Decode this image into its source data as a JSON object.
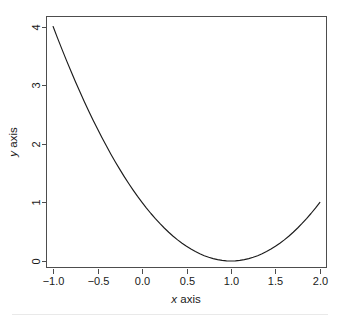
{
  "figure": {
    "background_color": "#ffffff",
    "ink_color": "#1c1c1c",
    "axis_color": "#4d4d4d",
    "xlabel_var": "x",
    "xlabel_rest": " axis",
    "ylabel_var": "y",
    "ylabel_rest": " axis"
  },
  "chart_data": {
    "type": "line",
    "title": "",
    "subtitle": "",
    "xlabel": "x axis",
    "ylabel": "y axis",
    "grid": false,
    "legend": false,
    "legend_position": "none",
    "xlim": [
      -1.08,
      2.08
    ],
    "ylim": [
      -0.12,
      4.18
    ],
    "xticks": [
      -1.0,
      -0.5,
      0.0,
      0.5,
      1.0,
      1.5,
      2.0
    ],
    "xticklabels": [
      "-1.0",
      "-0.5",
      "0.0",
      "0.5",
      "1.0",
      "1.5",
      "2.0"
    ],
    "yticks": [
      0,
      1,
      2,
      3,
      4
    ],
    "yticklabels": [
      "0",
      "1",
      "2",
      "3",
      "4"
    ],
    "ytick_label_rotation": -90,
    "function": "y = (x - 1)^2",
    "series": [
      {
        "name": "y = (x - 1)^2",
        "color": "#1c1c1c",
        "x": [
          -1.0,
          -0.95,
          -0.9,
          -0.85,
          -0.8,
          -0.75,
          -0.7,
          -0.65,
          -0.6,
          -0.55,
          -0.5,
          -0.45,
          -0.4,
          -0.35,
          -0.3,
          -0.25,
          -0.2,
          -0.15,
          -0.1,
          -0.05,
          0.0,
          0.05,
          0.1,
          0.15,
          0.2,
          0.25,
          0.3,
          0.35,
          0.4,
          0.45,
          0.5,
          0.55,
          0.6,
          0.65,
          0.7,
          0.75,
          0.8,
          0.85,
          0.9,
          0.95,
          1.0,
          1.05,
          1.1,
          1.15,
          1.2,
          1.25,
          1.3,
          1.35,
          1.4,
          1.45,
          1.5,
          1.55,
          1.6,
          1.65,
          1.7,
          1.75,
          1.8,
          1.85,
          1.9,
          1.95,
          2.0
        ],
        "y": [
          4.0,
          3.8025,
          3.61,
          3.4225,
          3.24,
          3.0625,
          2.89,
          2.7225,
          2.56,
          2.4025,
          2.25,
          2.1025,
          1.96,
          1.8225,
          1.69,
          1.5625,
          1.44,
          1.3225,
          1.21,
          1.1025,
          1.0,
          0.9025,
          0.81,
          0.7225,
          0.64,
          0.5625,
          0.49,
          0.4225,
          0.36,
          0.3025,
          0.25,
          0.2025,
          0.16,
          0.1225,
          0.09,
          0.0625,
          0.04,
          0.0225,
          0.01,
          0.0025,
          0.0,
          0.0025,
          0.01,
          0.0225,
          0.04,
          0.0625,
          0.09,
          0.1225,
          0.16,
          0.2025,
          0.25,
          0.3025,
          0.36,
          0.4225,
          0.49,
          0.5625,
          0.64,
          0.7225,
          0.81,
          0.9025,
          1.0
        ]
      }
    ],
    "annotations": [],
    "notable_points": {
      "minimum": {
        "x": 1.0,
        "y": 0.0
      },
      "left_endpoint": {
        "x": -1.0,
        "y": 4.0
      },
      "right_endpoint": {
        "x": 2.0,
        "y": 1.0
      }
    }
  },
  "geometry": {
    "plot_left": 46,
    "plot_right": 327,
    "plot_top": 16,
    "plot_bottom": 268,
    "tick_length": 5
  }
}
